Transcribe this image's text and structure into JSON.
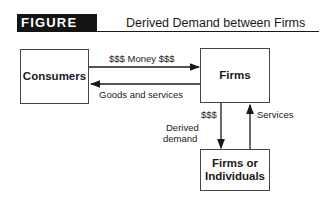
{
  "figure": {
    "label": "FIGURE 1.2",
    "title": "Derived Demand between Firms"
  },
  "nodes": {
    "consumers": "Consumers",
    "firms": "Firms",
    "firms_or_individuals_line1": "Firms or",
    "firms_or_individuals_line2": "Individuals"
  },
  "edges": {
    "money": "$$$ Money $$$",
    "goods_services": "Goods and services",
    "derived_money": "$$$",
    "derived_demand_line1": "Derived",
    "derived_demand_line2": "demand",
    "services": "Services"
  },
  "colors": {
    "label_bg": "#141414",
    "line": "#1a1a1a"
  }
}
